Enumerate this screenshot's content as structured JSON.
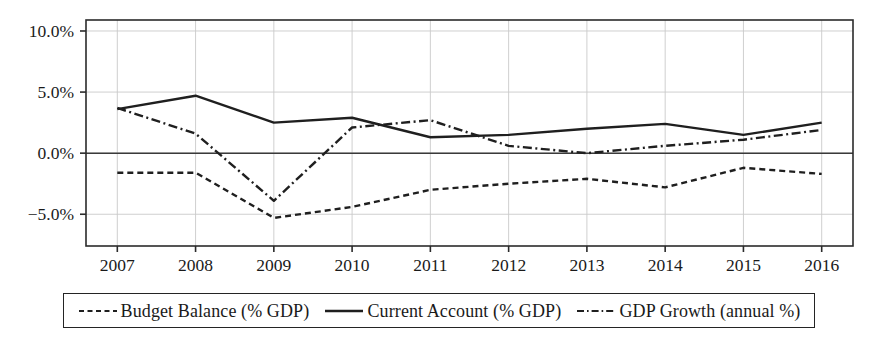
{
  "chart_data": {
    "type": "line",
    "title": "",
    "xlabel": "",
    "ylabel": "",
    "categories": [
      "2007",
      "2008",
      "2009",
      "2010",
      "2011",
      "2012",
      "2013",
      "2014",
      "2015",
      "2016"
    ],
    "x": [
      2007,
      2008,
      2009,
      2010,
      2011,
      2012,
      2013,
      2014,
      2015,
      2016
    ],
    "xlim": [
      2006.6,
      2016.4
    ],
    "ylim": [
      -7.6,
      10.9
    ],
    "yticks": [
      10,
      5,
      0,
      -5
    ],
    "ytick_labels": [
      "10.0%",
      "5.0%",
      "0.0%",
      "−5.0%"
    ],
    "xtick_labels": [
      "2007",
      "2008",
      "2009",
      "2010",
      "2011",
      "2012",
      "2013",
      "2014",
      "2015",
      "2016"
    ],
    "grid": true,
    "grid_axis": "both",
    "zero_line": true,
    "legend_position": "bottom",
    "series": [
      {
        "name": "Budget Balance (% GDP)",
        "style": "dashed",
        "color": "#1f1f1f",
        "values": [
          -1.6,
          -1.6,
          -5.3,
          -4.4,
          -3.0,
          -2.5,
          -2.1,
          -2.8,
          -1.2,
          -1.7
        ]
      },
      {
        "name": "Current Account (% GDP)",
        "style": "solid",
        "color": "#1f1f1f",
        "values": [
          3.6,
          4.7,
          2.5,
          2.9,
          1.3,
          1.5,
          2.0,
          2.4,
          1.5,
          2.5
        ]
      },
      {
        "name": "GDP Growth (annual %)",
        "style": "dashdot",
        "color": "#1f1f1f",
        "values": [
          3.7,
          1.6,
          -3.9,
          2.1,
          2.7,
          0.6,
          0.0,
          0.6,
          1.1,
          1.9
        ]
      }
    ]
  },
  "legend": {
    "items": [
      {
        "label": "Budget Balance (% GDP)",
        "style": "dashed"
      },
      {
        "label": "Current Account (% GDP)",
        "style": "solid"
      },
      {
        "label": "GDP Growth (annual %)",
        "style": "dashdot"
      }
    ]
  },
  "axes": {
    "frame_color": "#2b2b2b",
    "grid_color": "#c9c9c9",
    "zero_line_color": "#3a3a3a"
  }
}
